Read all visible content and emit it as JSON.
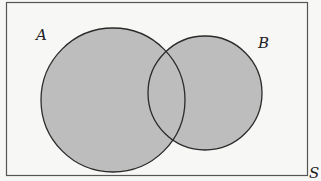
{
  "diagram": {
    "type": "venn",
    "universe": {
      "label": "S"
    },
    "sets": [
      {
        "label": "A",
        "cx": 113,
        "cy": 100,
        "r": 72
      },
      {
        "label": "B",
        "cx": 205,
        "cy": 93,
        "r": 57
      }
    ],
    "shaded_region": "A ∪ B",
    "colors": {
      "background": "#f7f7f5",
      "shade": "#bdbdbd",
      "stroke": "#2a2a2a",
      "frame": "#555555"
    }
  }
}
